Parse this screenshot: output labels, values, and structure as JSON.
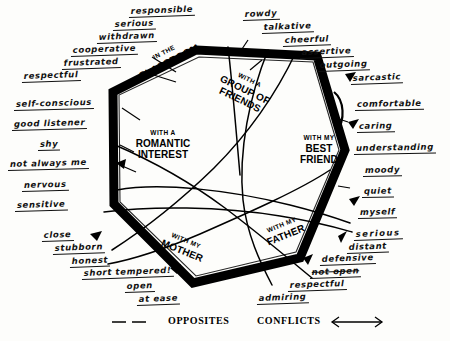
{
  "diagram": {
    "legend": [
      {
        "key": "opposites",
        "label": "OPPOSITES",
        "symbol": "dashed-line"
      },
      {
        "key": "conflicts",
        "label": "CONFLICTS",
        "symbol": "double-arrow"
      }
    ],
    "hex_labels": [
      {
        "id": "classroom",
        "small": "IN THE",
        "big": "CLASSROOM",
        "big2": ""
      },
      {
        "id": "friends",
        "small": "WITH A",
        "big": "GROUP OF",
        "big2": "FRIENDS"
      },
      {
        "id": "best-friend",
        "small": "WITH MY",
        "big": "BEST",
        "big2": "FRIEND"
      },
      {
        "id": "father",
        "small": "WITH MY",
        "big": "FATHER",
        "big2": ""
      },
      {
        "id": "mother",
        "small": "WITH MY",
        "big": "MOTHER",
        "big2": ""
      },
      {
        "id": "romantic",
        "small": "WITH A",
        "big": "ROMANTIC",
        "big2": "INTEREST"
      }
    ],
    "groups": [
      {
        "id": "classroom-traits",
        "context": "IN THE CLASSROOM",
        "position": "top-left",
        "words": [
          "responsible",
          "serious",
          "withdrawn",
          "cooperative",
          "frustrated",
          "respectful"
        ]
      },
      {
        "id": "friends-traits",
        "context": "WITH A GROUP OF FRIENDS",
        "position": "top-right",
        "words": [
          "rowdy",
          "talkative",
          "cheerful",
          "assertive",
          "outgoing",
          "sarcastic"
        ]
      },
      {
        "id": "romantic-traits",
        "context": "WITH A ROMANTIC INTEREST",
        "position": "left",
        "words": [
          "self-conscious",
          "good listener",
          "shy",
          "not always me",
          "nervous",
          "sensitive"
        ]
      },
      {
        "id": "best-friend-traits",
        "context": "WITH MY BEST FRIEND",
        "position": "right",
        "words": [
          "comfortable",
          "caring",
          "understanding",
          "moody",
          "quiet",
          "myself"
        ]
      },
      {
        "id": "mother-traits",
        "context": "WITH MY MOTHER",
        "position": "bottom-left",
        "words": [
          "close",
          "stubborn",
          "honest",
          "short tempered!",
          "open",
          "at ease"
        ]
      },
      {
        "id": "father-traits",
        "context": "WITH MY FATHER",
        "position": "bottom-right",
        "words": [
          "serious",
          "distant",
          "defensive",
          "not open",
          "respectful",
          "admiring"
        ]
      }
    ],
    "colors": {
      "ink": "#111111",
      "paper": "#fdfdfb",
      "hex_stroke": "#000000"
    }
  }
}
